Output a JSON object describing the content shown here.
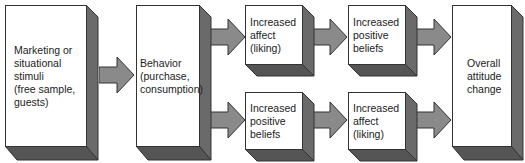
{
  "diagram": {
    "boxes": [
      {
        "id": "stimuli",
        "label": "Marketing or\nsituational\nstimuli\n(free sample,\nguests)"
      },
      {
        "id": "behavior",
        "label": "Behavior\n(purchase,\nconsumption)"
      },
      {
        "id": "top_affect",
        "label": "Increased\naffect\n(liking)"
      },
      {
        "id": "top_beliefs",
        "label": "Increased\npositive\nbeliefs"
      },
      {
        "id": "bottom_beliefs",
        "label": "Increased\npositive\nbeliefs"
      },
      {
        "id": "bottom_affect",
        "label": "Increased\naffect\n(liking)"
      },
      {
        "id": "attitude",
        "label": "Overall\nattitude\nchange"
      }
    ],
    "arrows": [
      {
        "from": "stimuli",
        "to": "behavior"
      },
      {
        "from": "behavior",
        "to": "top_affect"
      },
      {
        "from": "top_affect",
        "to": "top_beliefs"
      },
      {
        "from": "top_beliefs",
        "to": "attitude"
      },
      {
        "from": "behavior",
        "to": "bottom_beliefs"
      },
      {
        "from": "bottom_beliefs",
        "to": "bottom_affect"
      },
      {
        "from": "bottom_affect",
        "to": "attitude"
      }
    ],
    "colors": {
      "face": "#ffffff",
      "side": "#6a6a6a",
      "bottom": "#555555",
      "arrow": "#8a8a8a",
      "outline": "#333333"
    }
  }
}
